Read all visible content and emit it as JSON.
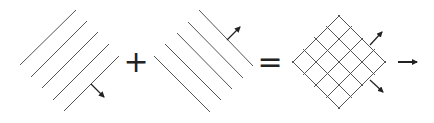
{
  "figure": {
    "operators": {
      "plus": "+",
      "equals": "="
    },
    "colors": {
      "line": "#555555",
      "arrow": "#222222",
      "background": "#ffffff"
    },
    "panels": [
      {
        "name": "wave-set-1",
        "orientation": "/",
        "line_count": 5,
        "arrow_direction": "down-right"
      },
      {
        "name": "wave-set-2",
        "orientation": "\\",
        "line_count": 5,
        "arrow_direction": "up-right"
      },
      {
        "name": "superposition-grid",
        "line_count_each": 5,
        "arrows": [
          "up-right",
          "down-right"
        ]
      },
      {
        "name": "resultant",
        "arrow_direction": "right"
      }
    ]
  }
}
